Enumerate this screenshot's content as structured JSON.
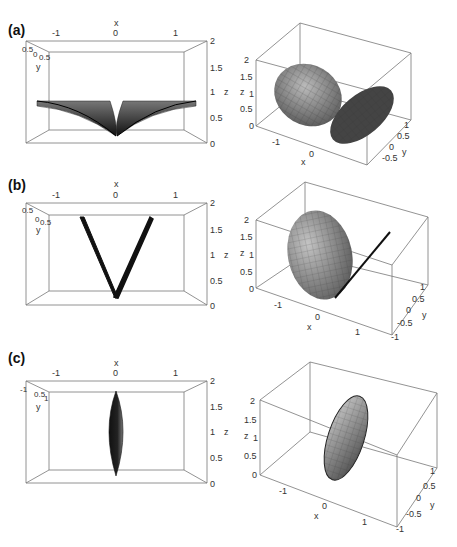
{
  "figure": {
    "rows": [
      {
        "label": "(a)",
        "front_view": {
          "x_axis_label": "x",
          "x_ticks": [
            "-1",
            "0",
            "1"
          ],
          "y_axis_label": "y",
          "y_ticks": [
            "-1",
            "0.5",
            "0",
            "0.5",
            "1"
          ],
          "z_axis_label": "z",
          "z_ticks": [
            "2",
            "1.5",
            "1",
            "0.5",
            "0"
          ],
          "shape": "two flat lobes forming wide V, tips at z≈0.8"
        },
        "perspective_view": {
          "x_axis_label": "x",
          "x_ticks": [
            "-1",
            "0"
          ],
          "y_axis_label": "y",
          "y_ticks": [
            "1",
            "0.5",
            "0",
            "-0.5"
          ],
          "z_axis_label": "z",
          "z_ticks": [
            "2",
            "1.5",
            "1",
            "0.5",
            "0"
          ],
          "shape": "two ellipsoidal lobes"
        }
      },
      {
        "label": "(b)",
        "front_view": {
          "x_axis_label": "x",
          "x_ticks": [
            "-1",
            "0",
            "1"
          ],
          "y_axis_label": "y",
          "y_ticks": [
            "-1",
            "0.5",
            "0",
            "0.5",
            "1"
          ],
          "z_axis_label": "z",
          "z_ticks": [
            "2",
            "1.5",
            "1",
            "0.5",
            "0"
          ],
          "shape": "narrow V, tips at z≈1.75"
        },
        "perspective_view": {
          "x_axis_label": "x",
          "x_ticks": [
            "-1",
            "0",
            "1"
          ],
          "y_axis_label": "y",
          "y_ticks": [
            "1",
            "0.5",
            "0",
            "-0.5",
            "-1"
          ],
          "z_axis_label": "z",
          "z_ticks": [
            "2",
            "1.5",
            "1",
            "0.5",
            "0"
          ],
          "shape": "one ellipsoidal lobe plus thin line"
        }
      },
      {
        "label": "(c)",
        "front_view": {
          "x_axis_label": "x",
          "x_ticks": [
            "-1",
            "0",
            "1"
          ],
          "y_axis_label": "y",
          "y_ticks": [
            "-1",
            "0.5",
            "0",
            "0.5",
            "1"
          ],
          "z_axis_label": "z",
          "z_ticks": [
            "2",
            "1.5",
            "1",
            "0.5",
            "0"
          ],
          "shape": "single vertical spindle"
        },
        "perspective_view": {
          "x_axis_label": "x",
          "x_ticks": [
            "-1",
            "0",
            "1"
          ],
          "y_axis_label": "y",
          "y_ticks": [
            "1",
            "0.5",
            "0",
            "-0.5",
            "-1"
          ],
          "z_axis_label": "z",
          "z_ticks": [
            "2",
            "1.5",
            "1",
            "0.5",
            "0"
          ],
          "shape": "single tilted ellipsoidal disk"
        }
      }
    ]
  }
}
